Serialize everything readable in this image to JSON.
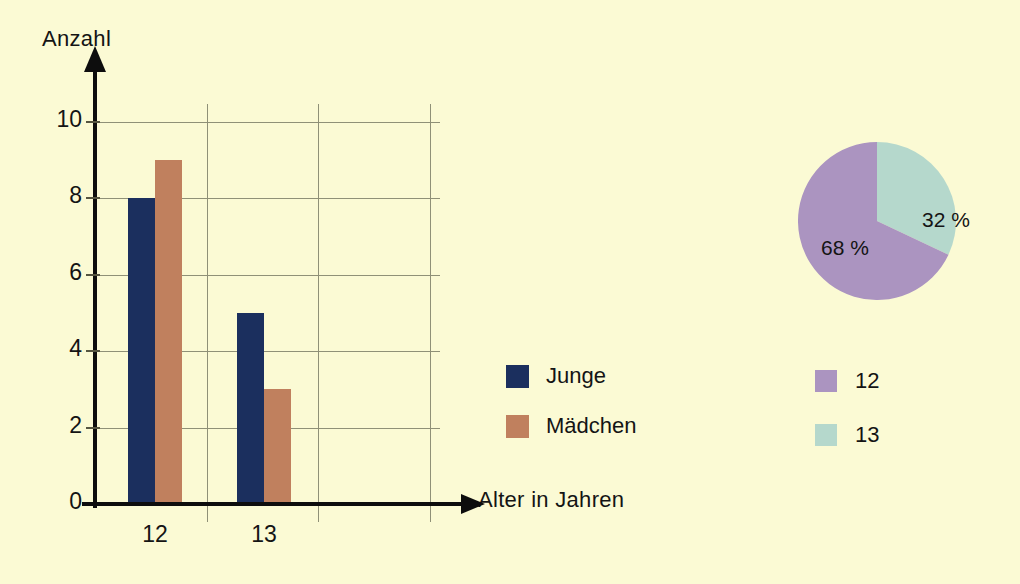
{
  "colors": {
    "background": "#fbfad4",
    "axis": "#0d0d0d",
    "grid": "#8f9077",
    "series_junge": "#1b2f5e",
    "series_maedchen": "#c0805e",
    "pie_12": "#ab94c0",
    "pie_13": "#b5d8cc"
  },
  "chart_data": [
    {
      "type": "bar",
      "title": "",
      "xlabel": "Alter in Jahren",
      "ylabel": "Anzahl",
      "categories": [
        "12",
        "13"
      ],
      "series": [
        {
          "name": "Junge",
          "values": [
            8,
            5
          ],
          "color": "#1b2f5e"
        },
        {
          "name": "Mädchen",
          "values": [
            9,
            3
          ],
          "color": "#c0805e"
        }
      ],
      "ylim": [
        0,
        10
      ],
      "yticks": [
        0,
        2,
        4,
        6,
        8,
        10
      ],
      "ytick_labels": [
        "0",
        "2",
        "4",
        "6",
        "8",
        "10"
      ],
      "grid": true,
      "legend_position": "right"
    },
    {
      "type": "pie",
      "title": "",
      "labels": [
        "12",
        "13"
      ],
      "values": [
        68,
        32
      ],
      "data_labels": [
        "68 %",
        "32 %"
      ],
      "colors": [
        "#ab94c0",
        "#b5d8cc"
      ],
      "legend_position": "below"
    }
  ],
  "bar_chart": {
    "y_axis_title": "Anzahl",
    "x_axis_title": "Alter in Jahren",
    "y_ticks": [
      "10",
      "8",
      "6",
      "4",
      "2",
      "0"
    ],
    "x_ticks": [
      "12",
      "13"
    ],
    "legend": [
      {
        "label": "Junge",
        "color": "#1b2f5e"
      },
      {
        "label": "Mädchen",
        "color": "#c0805e"
      }
    ],
    "groups": [
      {
        "category": "12",
        "bars": [
          {
            "series": "Junge",
            "value": 8
          },
          {
            "series": "Mädchen",
            "value": 9
          }
        ]
      },
      {
        "category": "13",
        "bars": [
          {
            "series": "Junge",
            "value": 5
          },
          {
            "series": "Mädchen",
            "value": 3
          }
        ]
      }
    ]
  },
  "pie_chart": {
    "slices": [
      {
        "label": "12",
        "percent_text": "68 %",
        "value": 68,
        "color": "#ab94c0"
      },
      {
        "label": "13",
        "percent_text": "32 %",
        "value": 32,
        "color": "#b5d8cc"
      }
    ],
    "legend": [
      {
        "label": "12",
        "color": "#ab94c0"
      },
      {
        "label": "13",
        "color": "#b5d8cc"
      }
    ]
  }
}
